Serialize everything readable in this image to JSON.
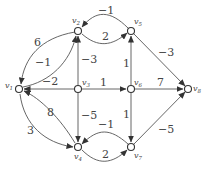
{
  "diagram": {
    "type": "directed-weighted-graph",
    "nodes": [
      {
        "id": "v1",
        "label": "v",
        "sub": "1",
        "x": 19,
        "y": 89
      },
      {
        "id": "v2",
        "label": "v",
        "sub": "2",
        "x": 78,
        "y": 31
      },
      {
        "id": "v3",
        "label": "v",
        "sub": "3",
        "x": 78,
        "y": 89
      },
      {
        "id": "v4",
        "label": "v",
        "sub": "4",
        "x": 78,
        "y": 147
      },
      {
        "id": "v5",
        "label": "v",
        "sub": "5",
        "x": 131,
        "y": 31
      },
      {
        "id": "v6",
        "label": "v",
        "sub": "6",
        "x": 131,
        "y": 89
      },
      {
        "id": "v7",
        "label": "v",
        "sub": "7",
        "x": 131,
        "y": 147
      },
      {
        "id": "v8",
        "label": "v",
        "sub": "8",
        "x": 188,
        "y": 89
      }
    ],
    "edges": [
      {
        "from": "v2",
        "to": "v1",
        "weight": "6"
      },
      {
        "from": "v1",
        "to": "v2",
        "weight": "−1"
      },
      {
        "from": "v3",
        "to": "v1",
        "weight": "−2"
      },
      {
        "from": "v4",
        "to": "v1",
        "weight": "8"
      },
      {
        "from": "v1",
        "to": "v4",
        "weight": "3"
      },
      {
        "from": "v5",
        "to": "v2",
        "weight": "−1"
      },
      {
        "from": "v2",
        "to": "v5",
        "weight": "2"
      },
      {
        "from": "v3",
        "to": "v2",
        "weight": "−3"
      },
      {
        "from": "v3",
        "to": "v6",
        "weight": "1"
      },
      {
        "from": "v3",
        "to": "v4",
        "weight": "−5"
      },
      {
        "from": "v6",
        "to": "v5",
        "weight": "1"
      },
      {
        "from": "v6",
        "to": "v7",
        "weight": "1"
      },
      {
        "from": "v5",
        "to": "v8",
        "weight": "−3"
      },
      {
        "from": "v6",
        "to": "v8",
        "weight": "7"
      },
      {
        "from": "v7",
        "to": "v8",
        "weight": "−5"
      },
      {
        "from": "v7",
        "to": "v4",
        "weight": "−1"
      },
      {
        "from": "v4",
        "to": "v7",
        "weight": "2"
      }
    ]
  }
}
